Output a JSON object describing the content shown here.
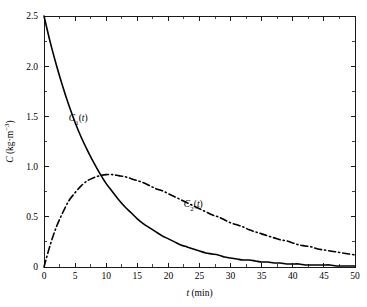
{
  "chart_data": {
    "type": "line",
    "title": "",
    "subtitle": "",
    "xlabel": "t (min)",
    "xlabel_parts": {
      "symbol": "t",
      "units": " (min)"
    },
    "ylabel": "C (kg·m⁻³)",
    "ylabel_parts": {
      "symbol": "C",
      "units": " (kg·m⁻³)"
    },
    "xlim": [
      0,
      50
    ],
    "ylim": [
      0,
      2.5
    ],
    "grid": false,
    "legend": "inline-curve-labels",
    "xticks": [
      0,
      5,
      10,
      15,
      20,
      25,
      30,
      35,
      40,
      45,
      50
    ],
    "xtick_labels": [
      "0",
      "5",
      "10",
      "15",
      "20",
      "25",
      "30",
      "35",
      "40",
      "45",
      "50"
    ],
    "xminor_step": 2.5,
    "yticks": [
      0,
      0.5,
      1.0,
      1.5,
      2.0,
      2.5
    ],
    "ytick_labels": [
      "0",
      "0.5",
      "1.0",
      "1.5",
      "2.0",
      "2.5"
    ],
    "yminor_step": 0.25,
    "x": [
      0,
      1,
      2,
      3,
      4,
      5,
      6,
      7,
      8,
      9,
      10,
      11,
      12,
      13,
      14,
      15,
      16,
      17,
      18,
      19,
      20,
      21,
      22,
      23,
      24,
      25,
      26,
      27,
      28,
      29,
      30,
      31,
      32,
      33,
      34,
      35,
      36,
      37,
      38,
      39,
      40,
      41,
      42,
      43,
      44,
      45,
      46,
      47,
      48,
      49,
      50
    ],
    "series": [
      {
        "name": "C_1(t)",
        "label": "C₁(t)",
        "label_parts": {
          "symbol": "C",
          "sub": "1",
          "arg": "(t)"
        },
        "style": "solid",
        "color": "#000000",
        "label_x": 5.5,
        "label_y": 1.45,
        "values": [
          2.5,
          2.24,
          2.01,
          1.8,
          1.61,
          1.44,
          1.29,
          1.16,
          1.04,
          0.93,
          0.83,
          0.75,
          0.67,
          0.6,
          0.54,
          0.48,
          0.43,
          0.39,
          0.35,
          0.31,
          0.28,
          0.25,
          0.22,
          0.2,
          0.18,
          0.16,
          0.14,
          0.13,
          0.12,
          0.1,
          0.09,
          0.08,
          0.07,
          0.07,
          0.06,
          0.05,
          0.05,
          0.04,
          0.04,
          0.03,
          0.03,
          0.03,
          0.02,
          0.02,
          0.02,
          0.02,
          0.02,
          0.01,
          0.01,
          0.01,
          0.01
        ]
      },
      {
        "name": "C_2(t)",
        "label": "C₂(t)",
        "label_parts": {
          "symbol": "C",
          "sub": "2",
          "arg": "(t)"
        },
        "style": "dash-dot",
        "color": "#000000",
        "label_x": 24.0,
        "label_y": 0.6,
        "values": [
          0.0,
          0.22,
          0.4,
          0.54,
          0.66,
          0.74,
          0.81,
          0.86,
          0.89,
          0.91,
          0.92,
          0.92,
          0.91,
          0.9,
          0.88,
          0.86,
          0.84,
          0.81,
          0.78,
          0.76,
          0.73,
          0.7,
          0.67,
          0.64,
          0.61,
          0.58,
          0.55,
          0.52,
          0.5,
          0.47,
          0.44,
          0.42,
          0.4,
          0.37,
          0.35,
          0.33,
          0.31,
          0.29,
          0.27,
          0.26,
          0.24,
          0.22,
          0.21,
          0.2,
          0.18,
          0.17,
          0.16,
          0.15,
          0.14,
          0.13,
          0.12
        ]
      }
    ],
    "annotations": [
      {
        "text": "C₁(t)",
        "x": 5.5,
        "y": 1.45
      },
      {
        "text": "C₂(t)",
        "x": 24.0,
        "y": 0.6
      }
    ]
  },
  "figure": {
    "background": "#ffffff",
    "axis_color": "#1a1a1a",
    "plot_left_px": 44,
    "plot_right_px": 355,
    "plot_top_px": 16,
    "plot_bottom_px": 267
  }
}
